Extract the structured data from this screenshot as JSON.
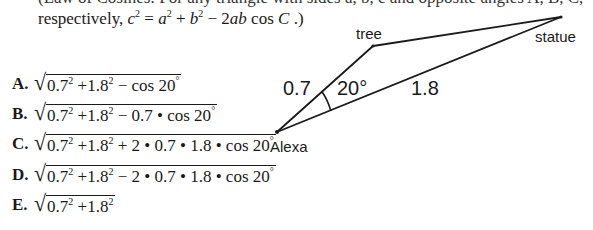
{
  "question": {
    "clipped_top_line": "(Law of Cosines: For any triangle with sides a, b, c and opposite angles A, B, C,",
    "intro_prefix": "respectively,",
    "formula": {
      "lhs": "c",
      "lhs_exp": "2",
      "eq": " = ",
      "a": "a",
      "a_exp": "2",
      "plus": " + ",
      "b": "b",
      "b_exp": "2",
      "minus": " − 2",
      "ab": "ab",
      "cos": " cos ",
      "C": "C",
      "end": " .)"
    }
  },
  "options": [
    {
      "letter": "A.",
      "t1": "0.7",
      "e1": "2",
      "t2": " +1.8",
      "e2": "2",
      "t3": " − cos 20",
      "deg": "°"
    },
    {
      "letter": "B.",
      "t1": "0.7",
      "e1": "2",
      "t2": " +1.8",
      "e2": "2",
      "t3": " − 0.7 • cos 20",
      "deg": "°"
    },
    {
      "letter": "C.",
      "t1": "0.7",
      "e1": "2",
      "t2": " +1.8",
      "e2": "2",
      "t3": " + 2 • 0.7 • 1.8 • cos 20",
      "deg": "°"
    },
    {
      "letter": "D.",
      "t1": "0.7",
      "e1": "2",
      "t2": " +1.8",
      "e2": "2",
      "t3": " − 2 • 0.7 • 1.8 • cos 20",
      "deg": "°"
    },
    {
      "letter": "E.",
      "t1": "0.7",
      "e1": "2",
      "t2": " +1.8",
      "e2": "2",
      "t3": "",
      "deg": ""
    }
  ],
  "diagram": {
    "points": {
      "alexa": {
        "label": "Alexa",
        "x": 277,
        "y": 132
      },
      "tree": {
        "label": "tree",
        "x": 373,
        "y": 46
      },
      "statue": {
        "label": "statue",
        "x": 561,
        "y": 17
      }
    },
    "side_alexa_tree": "0.7",
    "side_alexa_statue": "1.8",
    "angle_label": "20°",
    "line_color": "#1a1a1a"
  }
}
